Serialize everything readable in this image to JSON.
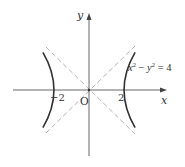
{
  "figure": {
    "type": "hyperbola-graph",
    "equation": {
      "lhs_x": "x",
      "lhs_x_exp": "2",
      "minus": " − ",
      "lhs_y": "y",
      "lhs_y_exp": "2",
      "rhs": " = 4"
    },
    "axes": {
      "x_label": "x",
      "y_label": "y",
      "origin_label": "O"
    },
    "ticks": {
      "left_vertex": "−2",
      "right_vertex": "2"
    },
    "curve_color": "#333333",
    "axis_color": "#555555",
    "asymptote_color": "#aaaaaa",
    "asymptotes": [
      "y = x",
      "y = −x"
    ],
    "vertices": [
      [
        -2,
        0
      ],
      [
        2,
        0
      ]
    ]
  }
}
